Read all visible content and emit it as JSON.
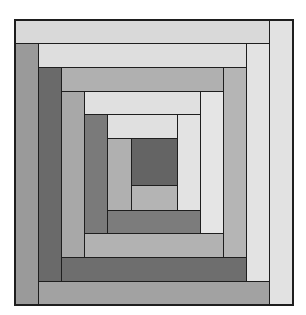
{
  "diagram": {
    "title": "Log Cabin quilt block",
    "type": "log-cabin-quilt-block",
    "frame": {
      "x": 14,
      "y": 19,
      "w": 279,
      "h": 286
    },
    "shades": {
      "darkest": "#646464",
      "dark": "#707070",
      "dark_alt": "#7a7a7a",
      "mid": "#9c9c9c",
      "mid_light": "#b2b2b2",
      "light": "#dcdcdc",
      "very_light": "#e4e4e4",
      "outline": "#1e1e1e"
    },
    "patches": [
      {
        "id": "top-outer",
        "round": 5,
        "side": "top",
        "x": 14,
        "y": 19,
        "w": 255,
        "h": 24,
        "color": "#d9d9d9"
      },
      {
        "id": "right-outer",
        "round": 5,
        "side": "right",
        "x": 269,
        "y": 19,
        "w": 24,
        "h": 286,
        "color": "#e2e2e2"
      },
      {
        "id": "left-outer",
        "round": 5,
        "side": "left",
        "x": 14,
        "y": 43,
        "w": 24,
        "h": 262,
        "color": "#9a9a9a"
      },
      {
        "id": "bottom-outer",
        "round": 5,
        "side": "bottom",
        "x": 38,
        "y": 281,
        "w": 231,
        "h": 24,
        "color": "#a2a2a2"
      },
      {
        "id": "top-4",
        "round": 4,
        "side": "top",
        "x": 38,
        "y": 43,
        "w": 208,
        "h": 24,
        "color": "#dedede"
      },
      {
        "id": "right-4",
        "round": 4,
        "side": "right",
        "x": 246,
        "y": 43,
        "w": 23,
        "h": 238,
        "color": "#e3e3e3"
      },
      {
        "id": "left-4",
        "round": 4,
        "side": "left",
        "x": 38,
        "y": 67,
        "w": 23,
        "h": 214,
        "color": "#6a6a6a"
      },
      {
        "id": "bottom-4",
        "round": 4,
        "side": "bottom",
        "x": 61,
        "y": 257,
        "w": 185,
        "h": 24,
        "color": "#6e6e6e"
      },
      {
        "id": "top-3",
        "round": 3,
        "side": "top",
        "x": 61,
        "y": 67,
        "w": 162,
        "h": 24,
        "color": "#b0b0b0"
      },
      {
        "id": "right-3",
        "round": 3,
        "side": "right",
        "x": 223,
        "y": 67,
        "w": 23,
        "h": 190,
        "color": "#b5b5b5"
      },
      {
        "id": "left-3",
        "round": 3,
        "side": "left",
        "x": 61,
        "y": 91,
        "w": 23,
        "h": 166,
        "color": "#a8a8a8"
      },
      {
        "id": "bottom-3",
        "round": 3,
        "side": "bottom",
        "x": 84,
        "y": 233,
        "w": 139,
        "h": 24,
        "color": "#b2b2b2"
      },
      {
        "id": "top-2",
        "round": 2,
        "side": "top",
        "x": 84,
        "y": 91,
        "w": 116,
        "h": 23,
        "color": "#e0e0e0"
      },
      {
        "id": "right-2",
        "round": 2,
        "side": "right",
        "x": 200,
        "y": 91,
        "w": 23,
        "h": 142,
        "color": "#e5e5e5"
      },
      {
        "id": "left-2",
        "round": 2,
        "side": "left",
        "x": 84,
        "y": 114,
        "w": 23,
        "h": 119,
        "color": "#7a7a7a"
      },
      {
        "id": "bottom-2",
        "round": 2,
        "side": "bottom",
        "x": 107,
        "y": 210,
        "w": 93,
        "h": 23,
        "color": "#7c7c7c"
      },
      {
        "id": "top-1",
        "round": 1,
        "side": "top",
        "x": 107,
        "y": 114,
        "w": 70,
        "h": 24,
        "color": "#e0e0e0"
      },
      {
        "id": "right-1",
        "round": 1,
        "side": "right",
        "x": 177,
        "y": 114,
        "w": 23,
        "h": 96,
        "color": "#e3e3e3"
      },
      {
        "id": "left-1",
        "round": 1,
        "side": "left",
        "x": 107,
        "y": 138,
        "w": 24,
        "h": 72,
        "color": "#b0b0b0"
      },
      {
        "id": "bottom-1",
        "round": 1,
        "side": "bottom",
        "x": 131,
        "y": 185,
        "w": 46,
        "h": 25,
        "color": "#b4b4b4"
      },
      {
        "id": "center",
        "round": 0,
        "side": "center",
        "x": 131,
        "y": 138,
        "w": 46,
        "h": 47,
        "color": "#646464"
      }
    ]
  }
}
